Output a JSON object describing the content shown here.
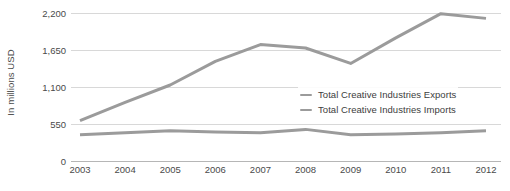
{
  "chart_data": {
    "type": "line",
    "title": "",
    "subtitle": "",
    "xlabel": "",
    "ylabel": "In millions USD",
    "x": [
      "2003",
      "2004",
      "2005",
      "2006",
      "2007",
      "2008",
      "2009",
      "2010",
      "2011",
      "2012"
    ],
    "categories": [
      "2003",
      "2004",
      "2005",
      "2006",
      "2007",
      "2008",
      "2009",
      "2010",
      "2011",
      "2012"
    ],
    "series": [
      {
        "name": "Total Creative Industries Exports",
        "color": "#9b9b9b",
        "values": [
          600,
          870,
          1130,
          1480,
          1730,
          1680,
          1450,
          1830,
          2190,
          2120
        ]
      },
      {
        "name": "Total Creative Industries Imports",
        "color": "#9b9b9b",
        "values": [
          390,
          420,
          450,
          430,
          420,
          470,
          390,
          400,
          420,
          450
        ]
      }
    ],
    "ylim": [
      0,
      2200
    ],
    "yticks": [
      0,
      550,
      1100,
      1650,
      2200
    ],
    "ytick_labels": [
      "0",
      "550",
      "1,100",
      "1,650",
      "2,200"
    ],
    "grid": true,
    "grid_color": "#d8d8d8",
    "legend_position": "center-right",
    "background": "#ffffff"
  },
  "legend": {
    "items": [
      {
        "label": "Total Creative Industries Exports"
      },
      {
        "label": "Total Creative Industries Imports"
      }
    ]
  }
}
